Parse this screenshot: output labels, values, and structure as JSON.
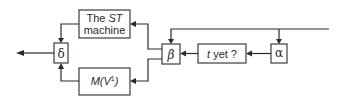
{
  "diagram": {
    "nodes": {
      "delta": {
        "label": "δ"
      },
      "st_machine": {
        "label_line1_prefix": "The ",
        "label_line1_italic": "ST",
        "label_line2": "machine"
      },
      "m_v1": {
        "label_italic": "M(V",
        "label_sup": "1",
        "label_close": ")"
      },
      "beta": {
        "label": "β"
      },
      "t_yet": {
        "label_italic": "t",
        "label_rest": " yet ?"
      },
      "alpha": {
        "label": "α"
      }
    },
    "edges": [
      {
        "from": "input",
        "to": "alpha"
      },
      {
        "from": "input",
        "to": "beta"
      },
      {
        "from": "alpha",
        "to": "t_yet"
      },
      {
        "from": "t_yet",
        "to": "beta"
      },
      {
        "from": "beta",
        "to": "st_machine"
      },
      {
        "from": "beta",
        "to": "m_v1"
      },
      {
        "from": "st_machine",
        "to": "delta"
      },
      {
        "from": "m_v1",
        "to": "delta"
      },
      {
        "from": "delta",
        "to": "output"
      }
    ],
    "colors": {
      "ink": "#2a2a2a",
      "background": "#ffffff"
    }
  }
}
